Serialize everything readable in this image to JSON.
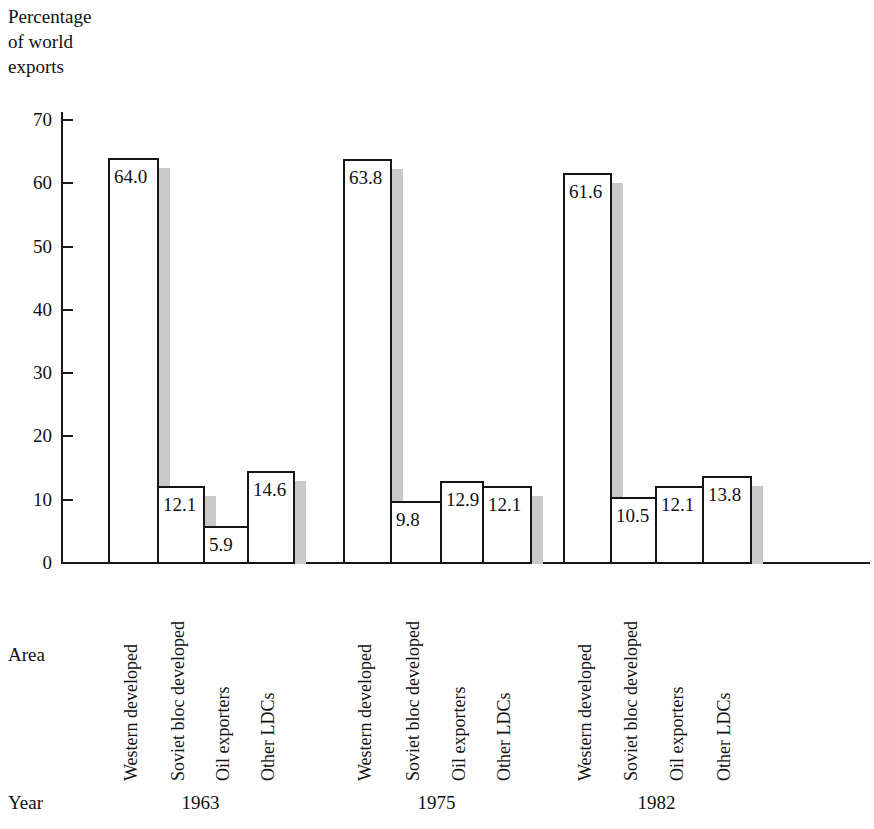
{
  "chart_data": {
    "type": "bar",
    "title": "Percentage\nof world\nexports",
    "xlabel": "Area",
    "ylabel": "Percentage of world exports",
    "grid": false,
    "legend": "none",
    "ylim": [
      0,
      70
    ],
    "yticks": [
      "0",
      "10",
      "20",
      "30",
      "40",
      "50",
      "60",
      "70"
    ],
    "categories": [
      "Western developed",
      "Soviet bloc developed",
      "Oil exporters",
      "Other LDCs"
    ],
    "groups": [
      "1963",
      "1975",
      "1982"
    ],
    "series": [
      {
        "name": "1963",
        "values": [
          64.0,
          12.1,
          5.9,
          14.6
        ],
        "labels": [
          "64.0",
          "12.1",
          "5.9",
          "14.6"
        ]
      },
      {
        "name": "1975",
        "values": [
          63.8,
          9.8,
          12.9,
          12.1
        ],
        "labels": [
          "63.8",
          "9.8",
          "12.9",
          "12.1"
        ]
      },
      {
        "name": "1982",
        "values": [
          61.6,
          10.5,
          12.1,
          13.8
        ],
        "labels": [
          "61.6",
          "10.5",
          "12.1",
          "13.8"
        ]
      }
    ],
    "colors": {
      "bar_fill": "#ffffff",
      "bar_stroke": "#151515",
      "shadow": "#c9c9c9",
      "axis": "#1a1a1a",
      "text": "#111111",
      "background": "#ffffff"
    }
  },
  "axis": {
    "title": "Percentage\nof world\nexports",
    "area_row_label": "Area",
    "year_row_label": "Year",
    "tick_70": "70",
    "tick_60": "60",
    "tick_50": "50",
    "tick_40": "40",
    "tick_30": "30",
    "tick_20": "20",
    "tick_10": "10",
    "tick_0": "0"
  },
  "groups": [
    {
      "year": "1963",
      "bars": [
        {
          "category": "Western developed",
          "label": "64.0"
        },
        {
          "category": "Soviet bloc developed",
          "label": "12.1"
        },
        {
          "category": "Oil exporters",
          "label": "5.9"
        },
        {
          "category": "Other LDCs",
          "label": "14.6"
        }
      ]
    },
    {
      "year": "1975",
      "bars": [
        {
          "category": "Western developed",
          "label": "63.8"
        },
        {
          "category": "Soviet bloc developed",
          "label": "9.8"
        },
        {
          "category": "Oil exporters",
          "label": "12.9"
        },
        {
          "category": "Other LDCs",
          "label": "12.1"
        }
      ]
    },
    {
      "year": "1982",
      "bars": [
        {
          "category": "Western developed",
          "label": "61.6"
        },
        {
          "category": "Soviet bloc developed",
          "label": "10.5"
        },
        {
          "category": "Oil exporters",
          "label": "12.1"
        },
        {
          "category": "Other LDCs",
          "label": "13.8"
        }
      ]
    }
  ]
}
